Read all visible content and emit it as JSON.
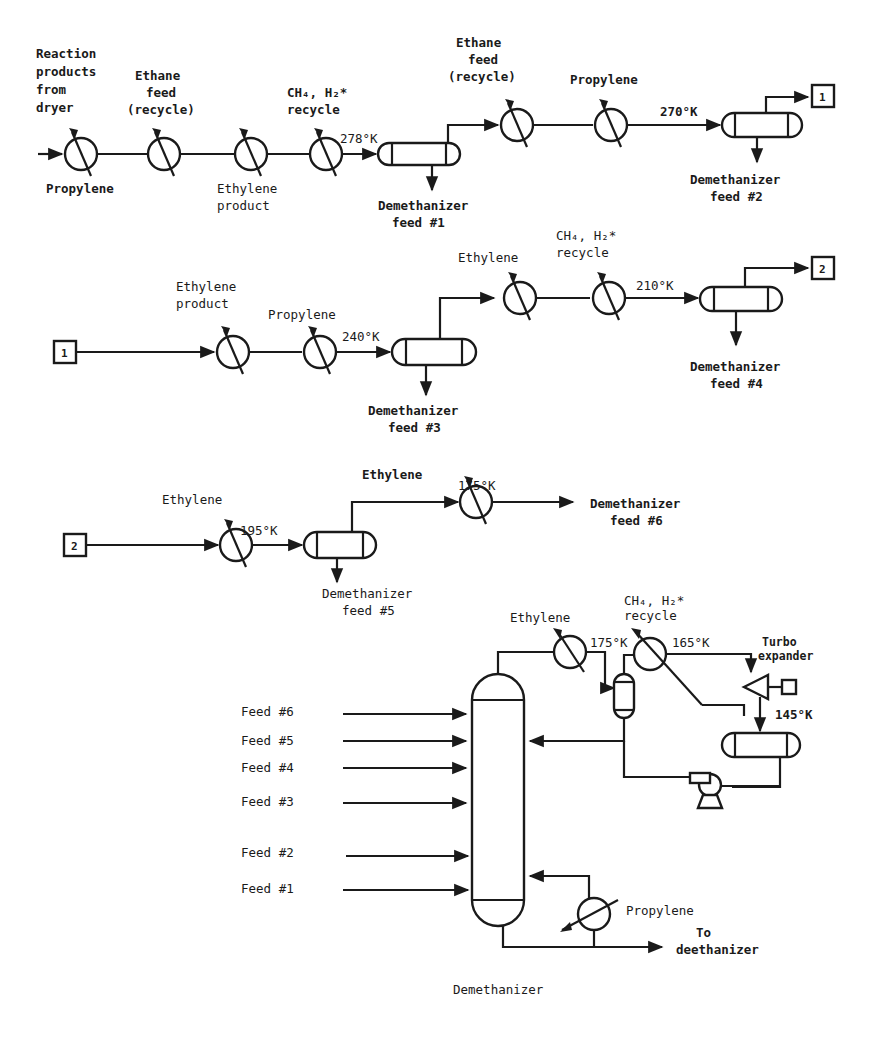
{
  "title": "Demethanizer",
  "colors": {
    "line": "#1a1a1a",
    "background": "#ffffff"
  },
  "row1": {
    "inlet_label": [
      "Reaction",
      "products",
      "from",
      "dryer"
    ],
    "hx1_label": "Propylene",
    "hx2_label": [
      "Ethane",
      "feed",
      "(recycle)"
    ],
    "hx3_label": [
      "Ethylene",
      "product"
    ],
    "hx4_label": [
      "CH₄, H₂*",
      "recycle"
    ],
    "temp1": "278°K",
    "drum1_label": [
      "Demethanizer",
      "feed #1"
    ],
    "hx5_label": [
      "Ethane",
      "feed",
      "(recycle)"
    ],
    "hx6_label": "Propylene",
    "temp2": "270°K",
    "drum2_label": [
      "Demethanizer",
      "feed #2"
    ],
    "connector": "1"
  },
  "row2": {
    "connector_in": "1",
    "hx1_label": [
      "Ethylene",
      "product"
    ],
    "hx2_label": "Propylene",
    "temp1": "240°K",
    "drum3_label": [
      "Demethanizer",
      "feed #3"
    ],
    "hx3_label": "Ethylene",
    "hx4_label": [
      "CH₄, H₂*",
      "recycle"
    ],
    "temp2": "210°K",
    "drum4_label": [
      "Demethanizer",
      "feed #4"
    ],
    "connector_out": "2"
  },
  "row3": {
    "connector_in": "2",
    "hx1_label": "Ethylene",
    "temp1": "195°K",
    "drum5_label": [
      "Demethanizer",
      "feed #5"
    ],
    "hx2_label": "Ethylene",
    "temp2": "175°K",
    "outlet_label": [
      "Demethanizer",
      "feed #6"
    ]
  },
  "column": {
    "feeds": [
      "Feed #6",
      "Feed #5",
      "Feed #4",
      "Feed #3",
      "Feed #2",
      "Feed #1"
    ],
    "overhead_hx_label": "Ethylene",
    "overhead_temp": "175°K",
    "recycle_hx_label": [
      "CH₄, H₂*",
      "recycle"
    ],
    "recycle_temp": "165°K",
    "expander_label": [
      "Turbo",
      "expander"
    ],
    "expander_temp": "145°K",
    "reboiler_label": "Propylene",
    "bottoms_label": [
      "To",
      "deethanizer"
    ],
    "caption": "Demethanizer"
  }
}
